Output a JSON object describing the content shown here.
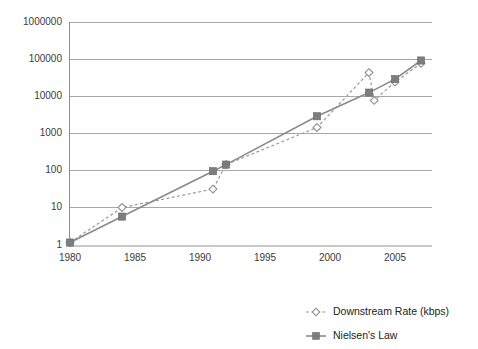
{
  "chart_data": {
    "type": "line",
    "title": "",
    "xlabel": "",
    "ylabel": "",
    "yscale": "log",
    "xlim": [
      1979,
      2008
    ],
    "ylim": [
      1,
      1000000
    ],
    "grid": true,
    "legend_position": "bottom-right",
    "y_ticks": [
      "1",
      "10",
      "100",
      "1000",
      "10000",
      "100000",
      "1000000"
    ],
    "y_tick_values": [
      1,
      10,
      100,
      1000,
      10000,
      100000,
      1000000
    ],
    "x_ticks": [
      "1980",
      "1985",
      "1990",
      "1995",
      "2000",
      "2005"
    ],
    "x_tick_values": [
      1980,
      1985,
      1990,
      1995,
      2000,
      2005
    ],
    "series": [
      {
        "name": "Downstream Rate (kbps)",
        "marker": "hollow-diamond",
        "linestyle": "dashed",
        "color": "#9a9a9a",
        "x": [
          1980,
          1984,
          1991,
          1992,
          1999,
          2003,
          2003.4,
          2005,
          2007
        ],
        "values": [
          1.2,
          10.5,
          33,
          150,
          1500,
          45000,
          8000,
          25000,
          80000
        ]
      },
      {
        "name": "Nielsen's Law",
        "marker": "filled-square",
        "linestyle": "solid",
        "color": "#8a8a8a",
        "x": [
          1980,
          1984,
          1991,
          1992,
          1999,
          2003,
          2005,
          2007
        ],
        "values": [
          1.2,
          6,
          100,
          150,
          3000,
          13000,
          30000,
          95000
        ]
      }
    ]
  },
  "legend": {
    "entries": [
      {
        "label": "Downstream Rate (kbps)"
      },
      {
        "label": "Nielsen's Law"
      }
    ]
  }
}
